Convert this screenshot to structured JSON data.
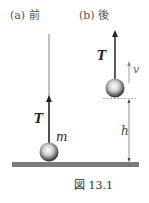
{
  "figure": {
    "caption": "図 13.1",
    "panel_a": {
      "label": "(a) 前",
      "tension_label": "T",
      "mass_label": "m"
    },
    "panel_b": {
      "label": "(b) 後",
      "tension_label": "T",
      "velocity_label": "v",
      "height_label": "h"
    },
    "colors": {
      "ground": "#7a7a7a",
      "rope": "#444444",
      "dim": "#888888"
    }
  }
}
